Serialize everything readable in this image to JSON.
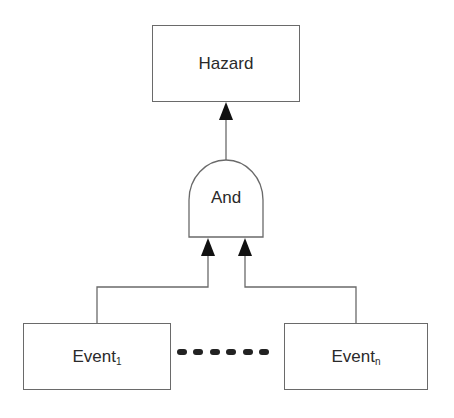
{
  "diagram": {
    "type": "fault-tree",
    "top_event": {
      "label": "Hazard"
    },
    "gate": {
      "label": "And",
      "kind": "AND"
    },
    "basic_events": [
      {
        "label": "Event",
        "subscript": "1"
      },
      {
        "label": "Event",
        "subscript": "n"
      }
    ],
    "ellipsis": "------",
    "colors": {
      "stroke": "#6a6a6a",
      "text": "#2a2a2a",
      "arrow": "#111111",
      "background": "#ffffff"
    }
  }
}
